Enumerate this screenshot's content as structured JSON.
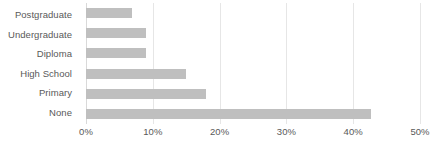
{
  "chart_data": {
    "type": "bar",
    "orientation": "horizontal",
    "title": "",
    "subtitle": "",
    "xlabel": "",
    "ylabel": "",
    "categories": [
      "Postgraduate",
      "Undergraduate",
      "Diploma",
      "High School",
      "Primary",
      "None"
    ],
    "values": [
      6.9,
      9.0,
      9.0,
      14.9,
      17.9,
      42.7
    ],
    "xlim": [
      0,
      50
    ],
    "ylim": null,
    "xticks": [
      0,
      10,
      20,
      30,
      40,
      50
    ],
    "xtick_labels": [
      "0%",
      "10%",
      "20%",
      "30%",
      "40%",
      "50%"
    ],
    "grid": "vertical",
    "legend": null,
    "legend_position": "none",
    "series": [
      {
        "name": "",
        "values": [
          6.9,
          9.0,
          9.0,
          14.9,
          17.9,
          42.7
        ]
      }
    ],
    "colors": {
      "bar": "#bfbfbf",
      "gridline": "#e6e6e6",
      "axis": "#d9d9d9",
      "text": "#595959",
      "background": "#ffffff"
    }
  }
}
